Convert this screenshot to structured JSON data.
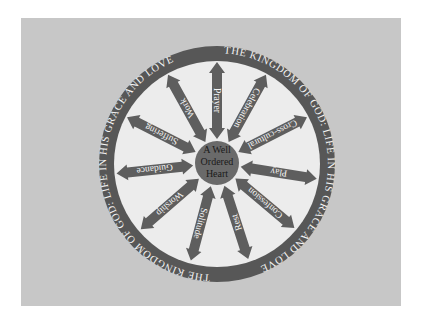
{
  "diagram": {
    "ring_text": "THE KINGDOM OF GOD: LIFE IN HIS GRACE AND LOVE",
    "hub": {
      "lines": [
        "A Well",
        "Ordered",
        "Heart"
      ]
    },
    "spokes": [
      {
        "label": "Prayer",
        "angle": 0
      },
      {
        "label": "Celebration",
        "angle": 29
      },
      {
        "label": "Cross-cultural",
        "angle": 63
      },
      {
        "label": "Play",
        "angle": 99
      },
      {
        "label": "Confession",
        "angle": 130
      },
      {
        "label": "Rest",
        "angle": 162
      },
      {
        "label": "Solitude",
        "angle": 195
      },
      {
        "label": "Worship",
        "angle": 229
      },
      {
        "label": "Guidance",
        "angle": 264
      },
      {
        "label": "Suffering",
        "angle": 297
      },
      {
        "label": "Work",
        "angle": 331
      }
    ],
    "colors": {
      "page_background": "#ffffff",
      "panel_background": "#c7c7c7",
      "ring": "#575757",
      "inner_disc": "#ececec",
      "spoke": "#5e5e5e",
      "hub": "#6a6a6a",
      "ring_text": "#f4f4f4",
      "hub_text": "#1a1a1a"
    }
  }
}
